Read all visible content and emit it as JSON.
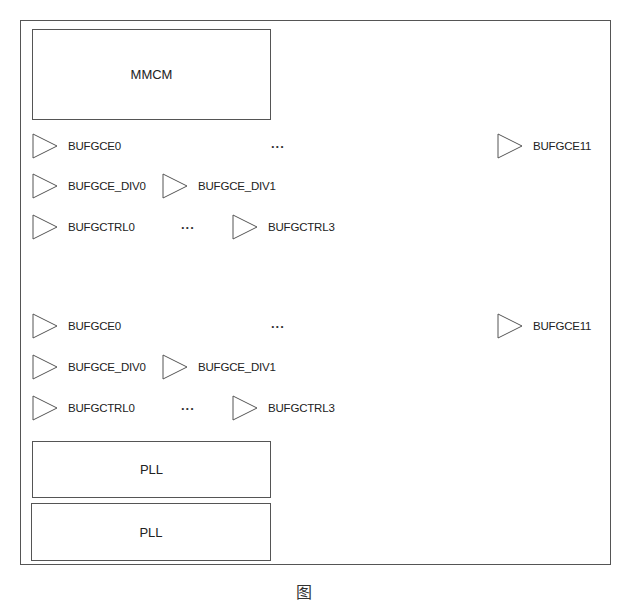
{
  "diagram": {
    "mmcm_label": "MMCM",
    "ellipsis": "...",
    "groups": [
      {
        "bufgce_first": "BUFGCE0",
        "bufgce_last": "BUFGCE11",
        "bufgce_div": [
          "BUFGCE_DIV0",
          "BUFGCE_DIV1"
        ],
        "bufgctrl_first": "BUFGCTRL0",
        "bufgctrl_last": "BUFGCTRL3"
      },
      {
        "bufgce_first": "BUFGCE0",
        "bufgce_last": "BUFGCE11",
        "bufgce_div": [
          "BUFGCE_DIV0",
          "BUFGCE_DIV1"
        ],
        "bufgctrl_first": "BUFGCTRL0",
        "bufgctrl_last": "BUFGCTRL3"
      }
    ],
    "pll_blocks": [
      "PLL",
      "PLL"
    ],
    "caption": "图"
  }
}
